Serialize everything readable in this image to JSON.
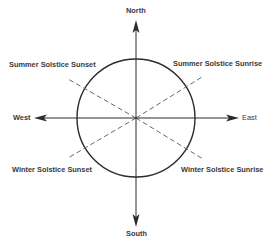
{
  "diagram": {
    "title": "",
    "center": {
      "x": 136,
      "y": 118
    },
    "circle_radius": 59,
    "colors": {
      "stroke": "#2b2b2b",
      "dashed": "#6a6a6a",
      "text": "#3a3a3a",
      "background": "#ffffff"
    },
    "directions": {
      "north": "North",
      "south": "South",
      "east": "East",
      "west": "West"
    },
    "solstice_lines": {
      "summer_sunset": "Summer Solstice Sunset",
      "summer_sunrise": "Summer Solstice Sunrise",
      "winter_sunset": "Winter Solstice Sunset",
      "winter_sunrise": "Winter Solstice Sunrise"
    }
  }
}
